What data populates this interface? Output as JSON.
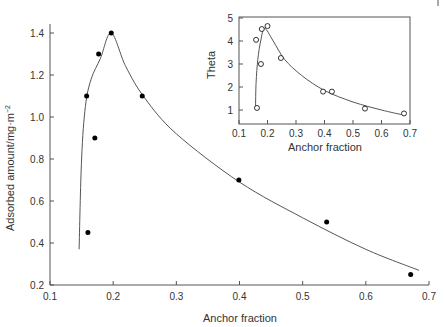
{
  "chart_data": [
    {
      "type": "scatter",
      "title": "",
      "xlabel": "Anchor fraction",
      "ylabel": "Adsorbed amount/mg·m⁻²",
      "xlim": [
        0.1,
        0.7
      ],
      "ylim": [
        0.2,
        1.45
      ],
      "xticks": [
        "0.1",
        "0.2",
        "0.3",
        "0.4",
        "0.5",
        "0.6",
        "0.7"
      ],
      "yticks": [
        "0.2",
        "0.4",
        "0.6",
        "0.8",
        "1.0",
        "1.2",
        "1.4"
      ],
      "grid": false,
      "marker": "filled-circle",
      "series": [
        {
          "name": "Adsorbed amount",
          "points": [
            {
              "x": 0.158,
              "y": 1.1
            },
            {
              "x": 0.16,
              "y": 0.45
            },
            {
              "x": 0.171,
              "y": 0.9
            },
            {
              "x": 0.177,
              "y": 1.3
            },
            {
              "x": 0.197,
              "y": 1.4
            },
            {
              "x": 0.246,
              "y": 1.1
            },
            {
              "x": 0.399,
              "y": 0.7
            },
            {
              "x": 0.538,
              "y": 0.5
            },
            {
              "x": 0.671,
              "y": 0.25
            }
          ]
        },
        {
          "name": "Fit curve",
          "type": "line",
          "points": [
            {
              "x": 0.146,
              "y": 0.37
            },
            {
              "x": 0.15,
              "y": 0.8
            },
            {
              "x": 0.156,
              "y": 1.05
            },
            {
              "x": 0.165,
              "y": 1.18
            },
            {
              "x": 0.18,
              "y": 1.28
            },
            {
              "x": 0.197,
              "y": 1.4
            },
            {
              "x": 0.22,
              "y": 1.24
            },
            {
              "x": 0.25,
              "y": 1.09
            },
            {
              "x": 0.3,
              "y": 0.92
            },
            {
              "x": 0.4,
              "y": 0.69
            },
            {
              "x": 0.5,
              "y": 0.52
            },
            {
              "x": 0.6,
              "y": 0.37
            },
            {
              "x": 0.684,
              "y": 0.27
            }
          ]
        }
      ]
    },
    {
      "type": "scatter",
      "title": "",
      "xlabel": "Anchor fraction",
      "ylabel": "Theta",
      "xlim": [
        0.1,
        0.7
      ],
      "ylim": [
        0.6,
        5
      ],
      "xticks": [
        "0.1",
        "0.2",
        "0.3",
        "0.4",
        "0.5",
        "0.6",
        "0.7"
      ],
      "yticks": [
        "1",
        "2",
        "3",
        "4",
        "5"
      ],
      "grid": false,
      "marker": "open-circle",
      "inset": true,
      "series": [
        {
          "name": "Theta",
          "points": [
            {
              "x": 0.16,
              "y": 4.05
            },
            {
              "x": 0.163,
              "y": 1.09
            },
            {
              "x": 0.177,
              "y": 3.0
            },
            {
              "x": 0.18,
              "y": 4.52
            },
            {
              "x": 0.2,
              "y": 4.65
            },
            {
              "x": 0.247,
              "y": 3.26
            },
            {
              "x": 0.395,
              "y": 1.8
            },
            {
              "x": 0.426,
              "y": 1.8
            },
            {
              "x": 0.542,
              "y": 1.06
            },
            {
              "x": 0.679,
              "y": 0.85
            }
          ]
        },
        {
          "name": "Fit curve",
          "type": "line",
          "points": [
            {
              "x": 0.158,
              "y": 1.1
            },
            {
              "x": 0.16,
              "y": 2.2
            },
            {
              "x": 0.166,
              "y": 3.2
            },
            {
              "x": 0.176,
              "y": 4.0
            },
            {
              "x": 0.19,
              "y": 4.55
            },
            {
              "x": 0.22,
              "y": 4.0
            },
            {
              "x": 0.26,
              "y": 3.2
            },
            {
              "x": 0.32,
              "y": 2.5
            },
            {
              "x": 0.4,
              "y": 1.85
            },
            {
              "x": 0.5,
              "y": 1.35
            },
            {
              "x": 0.6,
              "y": 1.0
            },
            {
              "x": 0.67,
              "y": 0.8
            }
          ]
        }
      ]
    }
  ],
  "labels": {
    "main_xlabel": "Anchor fraction",
    "main_ylabel": "Adsorbed amount/mg·m⁻²",
    "inset_xlabel": "Anchor fraction",
    "inset_ylabel": "Theta"
  }
}
